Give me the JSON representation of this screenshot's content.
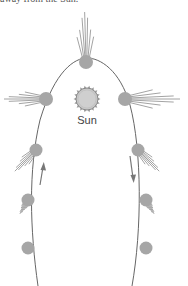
{
  "caption": "away from the Sun.",
  "sun": {
    "label": "Sun"
  },
  "colors": {
    "orbit": "#666666",
    "comet": "#a6a6a6",
    "tail": "#8c8c8c",
    "sun_fill": "#c8c8c8",
    "sun_stroke": "#888888",
    "arrow": "#777777"
  },
  "diagram": {
    "comet_count": 9,
    "arrows": [
      {
        "side": "left",
        "direction": "up"
      },
      {
        "side": "right",
        "direction": "down"
      }
    ]
  }
}
